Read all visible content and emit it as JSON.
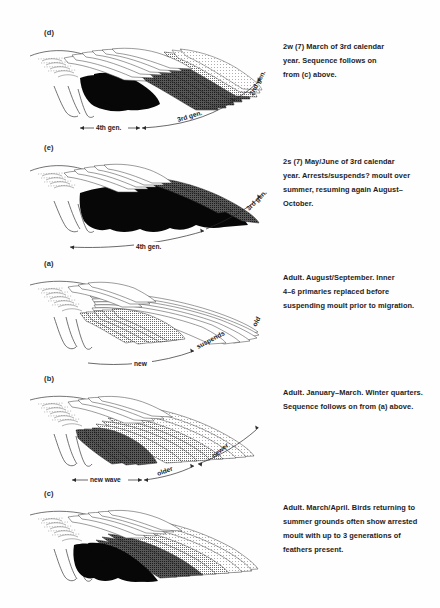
{
  "figure": {
    "background_color": "#ffffff",
    "ink_color": "#1a1a1a"
  },
  "panels": [
    {
      "id": "d",
      "label": "(d)",
      "caption": "2w (7) March of 3rd calendar year. Sequence follows on from (c) above.",
      "caption_lines": [
        "2w (7) March of 3rd calendar",
        "year. Sequence follows on",
        "from (c) above."
      ],
      "annotations": [
        {
          "text": "4th gen.",
          "kind": "double-arrow-label"
        },
        {
          "text": "3rd gen.",
          "kind": "double-arrow-label"
        },
        {
          "text": "2nd gen.",
          "kind": "arrow-label"
        }
      ],
      "feather_tones": [
        "white",
        "black",
        "dark-grey",
        "mid-grey",
        "light-grey"
      ]
    },
    {
      "id": "e",
      "label": "(e)",
      "caption": "2s (7) May/June of 3rd calendar year. Arrests/suspends? moult over summer, resuming again August–October.",
      "caption_lines": [
        "2s (7) May/June of 3rd calendar",
        "year. Arrests/suspends? moult over",
        "summer, resuming again August–",
        "October."
      ],
      "annotations": [
        {
          "text": "4th gen.",
          "kind": "double-arrow-label"
        },
        {
          "text": "3rd gen.",
          "kind": "arrow-label"
        }
      ],
      "feather_tones": [
        "white",
        "black",
        "dark-grey"
      ]
    },
    {
      "id": "a",
      "label": "(a)",
      "caption": "Adult. August/September. Inner 4–6 primaries replaced before suspending moult prior to migration.",
      "caption_lines": [
        "Adult. August/September. Inner",
        "4–6 primaries replaced before",
        "suspending moult prior to migration."
      ],
      "annotations": [
        {
          "text": "new",
          "kind": "arrow-label"
        },
        {
          "text": "suspends",
          "kind": "arrow-label"
        },
        {
          "text": "old",
          "kind": "plain-label"
        }
      ],
      "feather_tones": [
        "white",
        "mid-grey"
      ]
    },
    {
      "id": "b",
      "label": "(b)",
      "caption": "Adult. January–March. Winter quarters. Sequence follows on from (a) above.",
      "caption_lines": [
        "Adult. January–March. Winter quarters.",
        "Sequence follows on from (a) above."
      ],
      "annotations": [
        {
          "text": "new wave",
          "kind": "double-arrow-label"
        },
        {
          "text": "older",
          "kind": "double-arrow-label"
        },
        {
          "text": "newer",
          "kind": "arrow-label"
        }
      ],
      "feather_tones": [
        "white",
        "dark-grey",
        "light-grey",
        "mid-grey"
      ]
    },
    {
      "id": "c",
      "label": "(c)",
      "caption": "Adult. March/April. Birds returning to summer grounds often show arrested moult with up to 3 generations of feathers present.",
      "caption_lines": [
        "Adult. March/April. Birds returning to",
        "summer grounds often show arrested",
        "moult with up to 3 generations of",
        "feathers present."
      ],
      "annotations": [],
      "feather_tones": [
        "white",
        "black",
        "dark-grey",
        "mid-grey",
        "light-grey"
      ]
    }
  ],
  "tones": {
    "white": "#ffffff",
    "light_grey": "#c9c9c9",
    "mid_grey": "#9a9a9a",
    "dark_grey": "#5e5e5e",
    "darker_grey": "#3d3d3d",
    "black": "#050505"
  }
}
